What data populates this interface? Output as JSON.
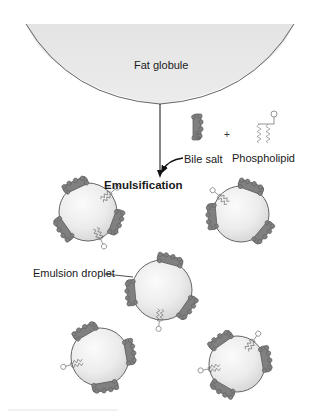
{
  "diagram": {
    "labels": {
      "fat_globule": "Fat globule",
      "bile_salt": "Bile salt",
      "plus": "+",
      "phospholipid": "Phospholipid",
      "emulsification": "Emulsification",
      "emulsion_droplet": "Emulsion droplet"
    },
    "nodes": [
      {
        "id": "fat-globule",
        "label": "Fat globule",
        "shape": "large-half-circle"
      },
      {
        "id": "bile-salt",
        "label": "Bile salt",
        "shape": "gray-molecule-icon"
      },
      {
        "id": "phospholipid",
        "label": "Phospholipid",
        "shape": "head-with-two-tails-icon"
      },
      {
        "id": "emulsion-droplets",
        "label": "Emulsion droplet",
        "count": 5,
        "shape": "small-spheres-coated-with-bile-salts-and-phospholipids"
      }
    ],
    "edges": [
      {
        "from": "fat-globule",
        "to": "emulsion-droplets",
        "label": "Emulsification",
        "type": "arrow"
      },
      {
        "from": "bile-salt",
        "to": "emulsification-arrow",
        "type": "curved-arrow"
      }
    ],
    "colors": {
      "globule_fill": "#e6e6e6",
      "globule_stroke": "#555555",
      "bile_salt": "#7f7f7f",
      "bile_salt_dark": "#5e5e5e",
      "phospholipid_line": "#777777",
      "text": "#1a1a1a"
    }
  }
}
